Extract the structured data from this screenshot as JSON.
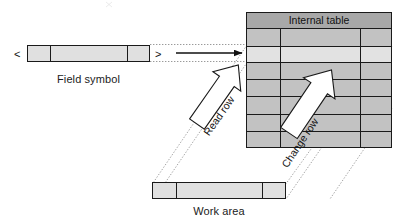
{
  "diagram": {
    "labels": {
      "internal_table": "Internal table",
      "field_symbol": "Field symbol",
      "work_area": "Work area",
      "read_row": "Read row",
      "change_row": "Change row",
      "bracket_open": "<",
      "bracket_close": ">"
    },
    "colors": {
      "header_fill": "#a8a8a8",
      "row_dark_fill": "#c2c2c2",
      "row_light_fill": "#e2e2e2",
      "bar_fill": "#e0e0e0",
      "stroke": "#1a1a1a",
      "guide_stroke": "#8c8c8c",
      "arrow_fill": "#ffffff",
      "background": "#ffffff",
      "text": "#1b1b1b"
    },
    "internal_table": {
      "x": 246,
      "y": 12,
      "width": 146,
      "height": 136,
      "header_height": 16,
      "column_dividers": [
        280,
        360
      ],
      "rows": [
        {
          "index": 0,
          "shade": "dark"
        },
        {
          "index": 1,
          "shade": "light"
        },
        {
          "index": 2,
          "shade": "dark"
        },
        {
          "index": 3,
          "shade": "dark"
        },
        {
          "index": 4,
          "shade": "dark"
        },
        {
          "index": 5,
          "shade": "dark"
        },
        {
          "index": 6,
          "shade": "dark"
        }
      ],
      "highlighted_row_index": 1
    },
    "field_symbol_bar": {
      "x": 27,
      "y": 45,
      "width": 123,
      "height": 17,
      "segment_dividers": [
        50,
        127
      ]
    },
    "work_area_bar": {
      "x": 152,
      "y": 182,
      "width": 134,
      "height": 17,
      "segment_dividers": [
        176,
        262
      ]
    },
    "pointer_arrow": {
      "from_x": 176,
      "to_x": 243,
      "y": 52,
      "style": "solid-black-thin"
    },
    "block_arrows": [
      {
        "name": "read-row",
        "label": "Read row",
        "direction": "down-left",
        "from": "internal-table",
        "to": "work-area"
      },
      {
        "name": "change-row",
        "label": "Change row",
        "direction": "up-right",
        "from": "work-area",
        "to": "internal-table"
      }
    ],
    "guide_lines": [
      {
        "name": "field-symbol-top-guide",
        "style": "dotted"
      },
      {
        "name": "field-symbol-bottom-guide",
        "style": "dotted"
      },
      {
        "name": "read-row-left-guide",
        "style": "dotted"
      },
      {
        "name": "read-row-right-guide",
        "style": "dotted"
      },
      {
        "name": "change-row-left-guide",
        "style": "dotted"
      },
      {
        "name": "change-row-right-guide",
        "style": "dotted"
      }
    ]
  }
}
